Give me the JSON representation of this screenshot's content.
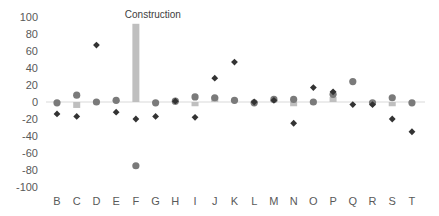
{
  "chart_data": {
    "type": "bar",
    "title": "",
    "xlabel": "",
    "ylabel": "",
    "ylim": [
      -100,
      100
    ],
    "yticks": [
      100,
      80,
      60,
      40,
      20,
      0,
      -20,
      -40,
      -60,
      -80,
      -100
    ],
    "grid": false,
    "legend": null,
    "categories": [
      "B",
      "C",
      "D",
      "E",
      "F",
      "G",
      "H",
      "I",
      "J",
      "K",
      "L",
      "M",
      "N",
      "O",
      "P",
      "Q",
      "R",
      "S",
      "T"
    ],
    "annotations": [
      {
        "text": "Construction",
        "category": "F"
      }
    ],
    "series": [
      {
        "name": "bars",
        "kind": "bar",
        "color": "#bfbfbf",
        "values": [
          0,
          -7,
          0,
          2,
          92,
          0,
          0,
          -5,
          6,
          2,
          -2,
          2,
          -5,
          0,
          6,
          0,
          -2,
          -5,
          0
        ]
      },
      {
        "name": "circles",
        "kind": "scatter-circle",
        "color": "#7a7a7a",
        "values": [
          -1,
          8,
          0,
          2,
          -75,
          -1,
          1,
          6,
          5,
          2,
          -1,
          3,
          3,
          0,
          9,
          24,
          -1,
          5,
          -1
        ]
      },
      {
        "name": "diamonds",
        "kind": "scatter-diamond",
        "color": "#333333",
        "values": [
          -14,
          -17,
          67,
          -12,
          -20,
          -17,
          1,
          -18,
          28,
          47,
          0,
          2,
          -25,
          17,
          12,
          -3,
          -3,
          -20,
          -35
        ]
      }
    ]
  },
  "layout": {
    "zero_y": 102,
    "px_per_unit": 0.85,
    "first_x": 57,
    "step_x": 19.72,
    "ylabel_x": 38,
    "axis_color": "#d9d9d9"
  }
}
